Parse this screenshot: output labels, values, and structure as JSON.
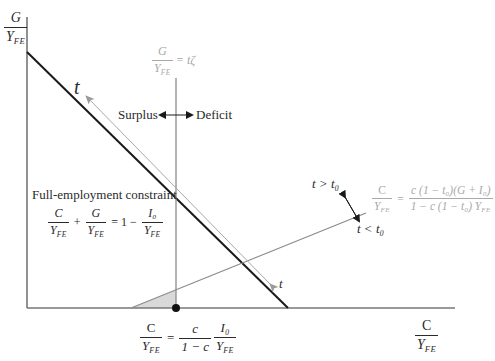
{
  "diagram": {
    "type": "economic-diagram",
    "axes": {
      "y_label": {
        "num": "G",
        "den": "Y",
        "den_sub": "FE"
      },
      "x_label": {
        "num": "C",
        "den": "Y",
        "den_sub": "FE"
      }
    },
    "lines": {
      "full_employment_line_label": "t",
      "tax_arrow_label": "t",
      "government_line": {
        "num": "G",
        "den": "Y",
        "den_sub": "FE",
        "rhs": "= tζ"
      },
      "consumption_line": {
        "lhs_num": "C",
        "lhs_den": "Y",
        "lhs_den_sub": "FE",
        "eq": "=",
        "rhs_num": "c (1 − t₀)(G + I₀)",
        "rhs_den": "1 − c (1 − t₀) Y",
        "rhs_den_sub": "FE"
      }
    },
    "annotations": {
      "surplus": "Surplus",
      "deficit": "Deficit",
      "t_greater": "t > t₀",
      "t_less": "t < t₀",
      "constraint_title": "Full-employment constraint",
      "constraint_eq": {
        "t1_num": "C",
        "t1_den": "Y",
        "t1_sub": "FE",
        "plus": "+",
        "t2_num": "G",
        "t2_den": "Y",
        "t2_sub": "FE",
        "eq": "= 1 −",
        "t3_num": "I₀",
        "t3_den": "Y",
        "t3_sub": "FE"
      },
      "intercept_eq": {
        "lhs_num": "C",
        "lhs_den": "Y",
        "lhs_sub": "FE",
        "eq": "=",
        "m_num": "c",
        "m_den": "1 − c",
        "r_num": "I₀",
        "r_den": "Y",
        "r_sub": "FE"
      }
    },
    "colors": {
      "axis": "#444444",
      "full_employment_line": "#1a1a1a",
      "gray_lines": "#8c8c8c",
      "light_text": "#a9a9a9",
      "shaded_area": "#d9d9d9",
      "dot": "#111111"
    }
  }
}
